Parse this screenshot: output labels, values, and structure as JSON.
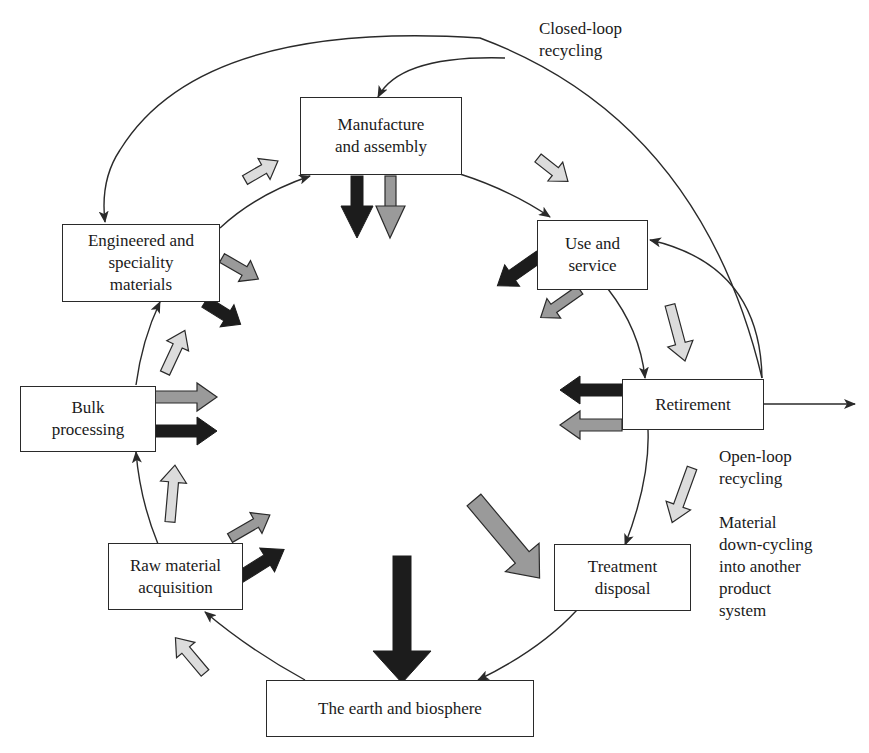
{
  "diagram": {
    "type": "material life cycle",
    "colors": {
      "line": "#2a2a2a",
      "arrow_dark": "#1c1c1c",
      "arrow_medium": "#9a9a9a",
      "arrow_light": "#dcdcdc"
    },
    "nodes": {
      "manufacture": "Manufacture\nand assembly",
      "use": "Use and\nservice",
      "retirement": "Retirement",
      "treatment": "Treatment\ndisposal",
      "earth": "The earth and biosphere",
      "raw": "Raw material\nacquisition",
      "bulk": "Bulk\nprocessing",
      "engineered": "Engineered and\nspeciality\nmaterials"
    },
    "labels": {
      "closed_loop": "Closed-loop\nrecycling",
      "open_loop": "Open-loop\nrecycling",
      "downcycling": "Material\ndown-cycling\ninto another\nproduct\nsystem"
    },
    "flows": [
      {
        "from": "earth",
        "to": "raw"
      },
      {
        "from": "raw",
        "to": "bulk"
      },
      {
        "from": "bulk",
        "to": "engineered"
      },
      {
        "from": "engineered",
        "to": "manufacture"
      },
      {
        "from": "manufacture",
        "to": "use"
      },
      {
        "from": "use",
        "to": "retirement"
      },
      {
        "from": "retirement",
        "to": "treatment"
      },
      {
        "from": "treatment",
        "to": "earth"
      },
      {
        "from": "retirement",
        "to": "use",
        "kind": "reuse"
      },
      {
        "from": "retirement",
        "to": "manufacture",
        "kind": "closed-loop recycling"
      },
      {
        "from": "retirement",
        "to": "engineered",
        "kind": "closed-loop recycling"
      },
      {
        "from": "retirement",
        "to": "outside",
        "kind": "open-loop recycling"
      }
    ]
  }
}
